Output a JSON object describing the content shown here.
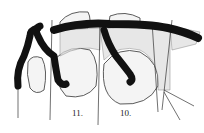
{
  "figure": {
    "labels": [
      {
        "text": "11.",
        "x": 72,
        "y": 108
      },
      {
        "text": "10.",
        "x": 120,
        "y": 108
      }
    ],
    "colors": {
      "ink": "#111111",
      "paper": "#ffffff",
      "stipple": "#888888"
    }
  }
}
